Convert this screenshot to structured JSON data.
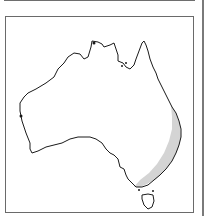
{
  "figure": {
    "type": "distribution-map",
    "region": "Australia",
    "colors": {
      "outline": "#1a1a1a",
      "range_fill": "#d4d4d4",
      "frame": "#6a6a6a",
      "background": "#ffffff"
    },
    "range_description": "eastern coastal strip (Queensland / New South Wales / Victoria) shaded"
  }
}
